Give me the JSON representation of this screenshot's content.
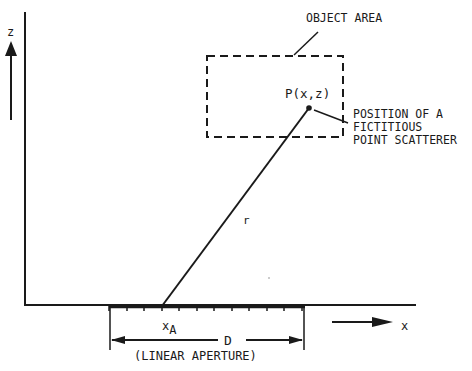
{
  "diagram": {
    "axes": {
      "z_label": "z",
      "x_label": "x"
    },
    "object_area": {
      "label": "OBJECT AREA",
      "point_label": "P(x,z)"
    },
    "scatterer_note": {
      "line1": "POSITION OF A",
      "line2": "FICTITIOUS",
      "line3": "POINT SCATTERER"
    },
    "range_label": "r",
    "aperture": {
      "element_label_base": "x",
      "element_label_sub": "A",
      "width_label": "D",
      "caption": "(LINEAR APERTURE)"
    },
    "colors": {
      "ink": "#1a1a1a",
      "background": "#ffffff"
    }
  }
}
